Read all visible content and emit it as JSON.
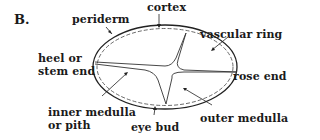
{
  "figure": {
    "panel_label": "B.",
    "labels": {
      "periderm": "periderm",
      "cortex": "cortex",
      "vascular_ring": "vascular ring",
      "heel_line1": "heel or",
      "heel_line2": "stem end",
      "rose_end": "rose end",
      "inner_medulla_line1": "inner medulla",
      "inner_medulla_line2": "or pith",
      "eye_bud": "eye bud",
      "outer_medulla": "outer medulla"
    }
  }
}
